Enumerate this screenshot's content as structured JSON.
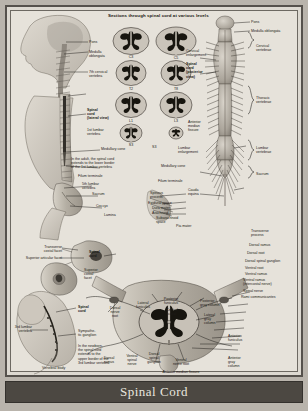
{
  "plate": {
    "caption": "Spinal Cord",
    "section_title": "Sections through spinal cord at various levels"
  },
  "cross_sections": {
    "column_left": [
      {
        "id": "cs-c3",
        "level": "C3"
      },
      {
        "id": "cs-t2",
        "level": "T2"
      },
      {
        "id": "cs-l1",
        "level": "L1"
      },
      {
        "id": "cs-s3",
        "level": "S3"
      }
    ],
    "column_right": [
      {
        "id": "cs-c5",
        "level": "C5"
      },
      {
        "id": "cs-t8",
        "level": "T8"
      },
      {
        "id": "cs-l3",
        "level": "L3"
      },
      {
        "id": "cs-s3b",
        "level": ""
      }
    ]
  },
  "head_panel": {
    "pons": "Pons",
    "medulla": "Medulla\noblongata",
    "cervical7": "7th cervical\nvertebra"
  },
  "torso_panel": {
    "spinal_cord_lateral": "Spinal\ncord\n(lateral view)",
    "lumbar1": "1st lumbar\nvertebra",
    "medullary_cone": "Medullary cone",
    "adult_note": "In the adult, the spinal cord\nextends to the lower border\nof the 1st lumbar vertebra",
    "filum_terminale": "Filum terminale",
    "lumbar5": "5th lumbar\nvertebra",
    "sacrum": "Sacrum",
    "coccyx": "Coccyx",
    "lamina": "Lamina"
  },
  "posterior_panel": {
    "pons": "Pons",
    "medulla": "Medulla oblongata",
    "cervical_enlargement": "Cervical\nenlargement",
    "spinal_cord_posterior": "Spinal\ncord\n(posterior\nview)",
    "cervical_vertebrae": "Cervical\nvertebrae",
    "thoracic_vertebrae": "Thoracic\nvertebrae",
    "lumbar_enlargement": "Lumbar\nenlargement",
    "lumbar_vertebrae": "Lumbar\nvertebrae",
    "sacrum": "Sacrum",
    "medullary_cone": "Medullary cone",
    "filum_terminale": "Filum terminale",
    "cauda_equina": "Cauda\nequina",
    "s3": "S3",
    "anterior_median_fissure": "Anterior\nmedian\nfissure"
  },
  "meninges_panel": {
    "spinous_process": "Spinous\nprocess",
    "epidural_space": "Epidural space",
    "dura_mater": "Dura mater",
    "arachnoid": "Arachnoid",
    "subarachnoid_space": "Subarachnoid\nspace",
    "pia_mater": "Pia mater"
  },
  "vertebra_panel": {
    "transverse_costal_facet": "Transverse\ncostal facet",
    "superior_articular_facet": "Superior articular facet",
    "spinal_cord": "Spinal\ncord",
    "superior_costal_facet": "Superior\ncostal\nfacet",
    "vertebral_body": "Vertebral body"
  },
  "newborn_panel": {
    "spinal_cord": "Spinal\ncord",
    "lumbar3": "3rd lumbar\nvertebra",
    "sympathetic_ganglion": "Sympathe-\ntic ganglion",
    "newborn_note": "In the newborn,\nthe spinal cord\nextends to the\nupper border of the\n3rd lumbar vertebra"
  },
  "segment_panel": {
    "transverse_process": "Transverse\nprocess",
    "dorsal_ramus": "Dorsal ramus",
    "dorsal_root": "Dorsal root",
    "dorsal_spinal_ganglion": "Dorsal spinal ganglion",
    "ventral_root": "Ventral root",
    "ventral_ramus": "Ventral ramus",
    "ventral_ramus_intercostal": "Ventral ramus\n(intercostal nerve)",
    "spinal_nerve": "Spinal nerve",
    "rami_communicantes": "Rami communicantes",
    "lateral_funiculus": "Lateral\nfuniculus",
    "posterior_funiculus": "Posterior\nfuniculus",
    "posterior_gray_column": "Posterior\ngray column",
    "central_canal": "Central\ncanal",
    "lateral_gray_column": "Lateral\ngray\ncolumn",
    "anterior_funiculus": "Anterior\nfuniculus",
    "anterior_gray_column": "Anterior\ngray\ncolumn",
    "dorsal_nerve_root": "Dorsal\nnerve\nroot",
    "dorsal_ramus_b": "Dorsal\nramus",
    "ventral_spinal_nerve": "Ventral\nspinal\nnerve",
    "dorsal_spinal_ganglion_b": "Dorsal\nspinal\nganglion",
    "ventral_nerve_root": "Ventral\nnerve root",
    "anterior_median_fissure": "Anterior median fissure"
  },
  "colors": {
    "plate_bg": "#e6e2da",
    "frame": "#55514c",
    "caption_bg": "#4c4842",
    "caption_text": "#e9e6df",
    "gray_matter": "#17150f",
    "white_matter": "#c9c4ba",
    "bone": "#b2aca1",
    "page_bg": "#b9b4ac"
  }
}
